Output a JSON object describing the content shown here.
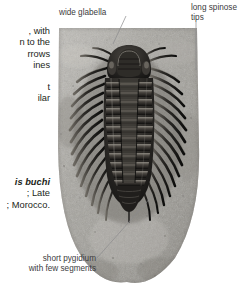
{
  "figure": {
    "type": "annotated-fossil-photograph"
  },
  "body_copy": {
    "paragraph_1": [
      ", with",
      "n to the",
      "rrows",
      "ines"
    ],
    "paragraph_2": [
      "t",
      "ilar"
    ]
  },
  "caption": {
    "species": "is buchi",
    "lines": [
      "; Late",
      "; Morocco."
    ]
  },
  "callouts": {
    "glabella": "wide glabella",
    "spinose": "long spinose tips",
    "pygidium_line1": "short pygidium",
    "pygidium_line2": "with few segments"
  },
  "colors": {
    "text": "#231f20",
    "callout_text": "#3b3b3d",
    "leader_line": "#8b8b8d",
    "matrix_light": "#b9b7b2",
    "matrix_mid": "#9a9792",
    "matrix_dark": "#6e6b66",
    "fossil_dark": "#1b1a18",
    "fossil_mid": "#3a3834",
    "fossil_highlight": "#8e8b84",
    "page_background": "#ffffff"
  }
}
